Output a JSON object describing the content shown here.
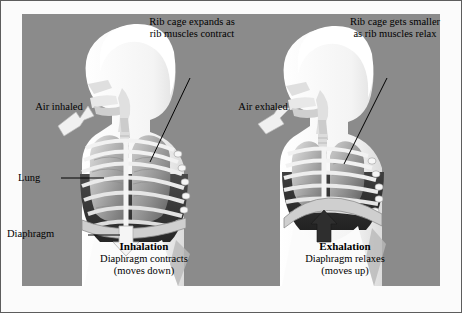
{
  "diagram": {
    "background_color": "#8b8b8b",
    "border_color": "#5d5d5d",
    "page_color": "#fbfbfb"
  },
  "left_panel": {
    "callout": "Rib cage expands as rib muscles contract",
    "air_label": "Air inhaled",
    "phase_title": "Inhalation",
    "phase_line1": "Diaphragm contracts",
    "phase_line2": "(moves down)",
    "arrow_direction": "down"
  },
  "right_panel": {
    "callout": "Rib cage gets smaller as rib muscles relax",
    "air_label": "Air exhaled",
    "phase_title": "Exhalation",
    "phase_line1": "Diaphragm relaxes",
    "phase_line2": "(moves up)",
    "arrow_direction": "up"
  },
  "side_labels": {
    "lung": "Lung",
    "diaphragm": "Diaphragm"
  },
  "colors": {
    "body_silhouette": "#fdfdfd",
    "rib": "#efefef",
    "lung_light": "#d8d8d8",
    "lung_mid": "#a9a9a9",
    "lung_dark": "#6d6d6d",
    "cavity_dark": "#3a3a3a",
    "outline": "#4a4a4a",
    "text": "#000000"
  }
}
